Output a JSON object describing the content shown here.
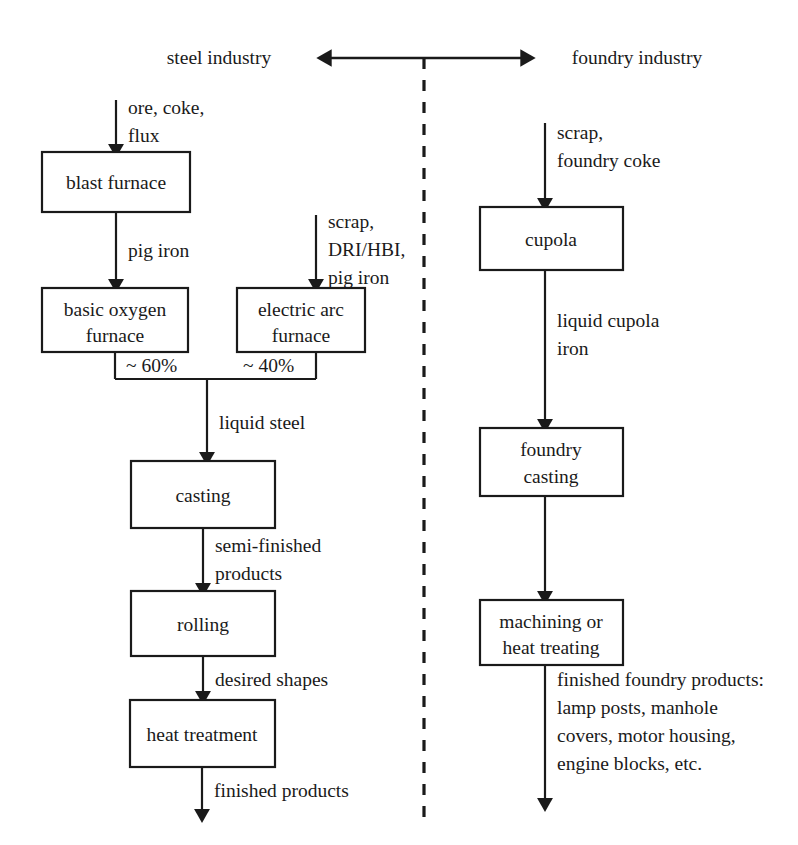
{
  "diagram": {
    "header": {
      "left_label": "steel industry",
      "right_label": "foundry industry",
      "axis_icon": "double-headed-arrow-icon",
      "divider_icon": "vertical-dashed-divider-icon"
    },
    "steel_branch": {
      "input_label_line1": "ore, coke,",
      "input_label_line2": "flux",
      "blast_furnace": "blast furnace",
      "pig_iron_label": "pig iron",
      "bof_line1": "basic oxygen",
      "bof_line2": "furnace",
      "eaf_input_line1": "scrap,",
      "eaf_input_line2": "DRI/HBI,",
      "eaf_input_line3": "pig iron",
      "eaf_line1": "electric arc",
      "eaf_line2": "furnace",
      "bof_share": "~ 60%",
      "eaf_share": "~ 40%",
      "liquid_steel_label": "liquid steel",
      "casting": "casting",
      "semi_finished_line1": "semi-finished",
      "semi_finished_line2": "products",
      "rolling": "rolling",
      "desired_shapes_label": "desired shapes",
      "heat_treatment": "heat treatment",
      "finished_products_label": "finished products"
    },
    "foundry_branch": {
      "input_line1": "scrap,",
      "input_line2": "foundry coke",
      "cupola": "cupola",
      "liquid_cupola_line1": "liquid cupola",
      "liquid_cupola_line2": "iron",
      "foundry_casting_line1": "foundry",
      "foundry_casting_line2": "casting",
      "machining_line1": "machining or",
      "machining_line2": "heat treating",
      "output_line1": "finished foundry products:",
      "output_line2": "lamp posts, manhole",
      "output_line3": "covers, motor housing,",
      "output_line4": "engine blocks, etc."
    },
    "colors": {
      "ink": "#1a1a1a",
      "paper": "#ffffff"
    }
  }
}
